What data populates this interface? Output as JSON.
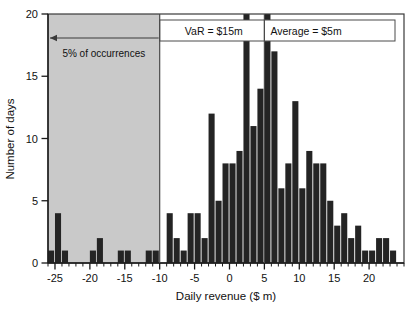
{
  "chart_data": {
    "type": "bar",
    "title": "",
    "subtitle": "",
    "xlabel": "Daily revenue ($ m)",
    "ylabel": "Number of days",
    "xlim": [
      -26,
      25
    ],
    "ylim": [
      0,
      20
    ],
    "grid": false,
    "legend_position": "none",
    "bin_width": 1,
    "x_ticks_major": [
      -25,
      -20,
      -15,
      -10,
      -5,
      0,
      5,
      10,
      15,
      20
    ],
    "x_tick_labels": [
      "-25",
      "-20",
      "-15",
      "-10",
      "-5",
      "0",
      "5",
      "10",
      "15",
      "20"
    ],
    "x_tick_minor_step": 1,
    "y_ticks": [
      0,
      5,
      10,
      15,
      20
    ],
    "y_tick_labels": [
      "0",
      "5",
      "10",
      "15",
      "20"
    ],
    "bin_left_edges": [
      -26,
      -25,
      -24,
      -23,
      -22,
      -21,
      -20,
      -19,
      -18,
      -17,
      -16,
      -15,
      -14,
      -13,
      -12,
      -11,
      -10,
      -9,
      -8,
      -7,
      -6,
      -5,
      -4,
      -3,
      -2,
      -1,
      0,
      1,
      2,
      3,
      4,
      5,
      6,
      7,
      8,
      9,
      10,
      11,
      12,
      13,
      14,
      15,
      16,
      17,
      18,
      19,
      20,
      21,
      22,
      23,
      24
    ],
    "values": [
      1,
      4,
      1,
      0,
      0,
      0,
      1,
      2,
      0,
      0,
      1,
      1,
      0,
      0,
      1,
      1,
      0,
      4,
      2,
      1,
      4,
      4,
      2,
      12,
      5,
      8,
      8,
      9,
      20,
      11,
      14,
      20,
      17,
      6,
      8,
      13,
      6,
      9,
      8,
      8,
      5,
      3,
      4,
      2,
      3,
      1,
      1,
      2,
      2,
      1,
      0
    ],
    "series": [
      {
        "name": "Daily revenue distribution",
        "values": [
          1,
          4,
          1,
          0,
          0,
          0,
          1,
          2,
          0,
          0,
          1,
          1,
          0,
          0,
          1,
          1,
          0,
          4,
          2,
          1,
          4,
          4,
          2,
          12,
          5,
          8,
          8,
          9,
          20,
          11,
          14,
          20,
          17,
          6,
          8,
          13,
          6,
          9,
          8,
          8,
          5,
          3,
          4,
          2,
          3,
          1,
          1,
          2,
          2,
          1,
          0
        ]
      }
    ],
    "annotations": [
      {
        "id": "var-callout",
        "text": "VaR = $15m",
        "marker_x": -10,
        "arrow_to_x": -26,
        "kind": "arrow-label"
      },
      {
        "id": "average-callout",
        "text": "Average = $5m",
        "marker_x": 5,
        "kind": "vline-label"
      },
      {
        "id": "tail-shade-label",
        "text": "5% of occurrences",
        "region": [
          -26,
          -10
        ],
        "kind": "shaded-region"
      }
    ],
    "shaded_region": {
      "label": "5% of occurrences",
      "x_from": -26,
      "x_to": -10,
      "color": "#c9c9c9"
    },
    "colors": {
      "bar": "#242424",
      "shade": "#c9c9c9",
      "axis": "#1a1a1a",
      "frame": "#3a3a3a",
      "background": "#ffffff"
    }
  },
  "labels": {
    "var_text": "VaR = $15m",
    "average_text": "Average = $5m",
    "shade_text": "5% of occurrences",
    "xlabel": "Daily revenue ($ m)",
    "ylabel": "Number of days"
  }
}
